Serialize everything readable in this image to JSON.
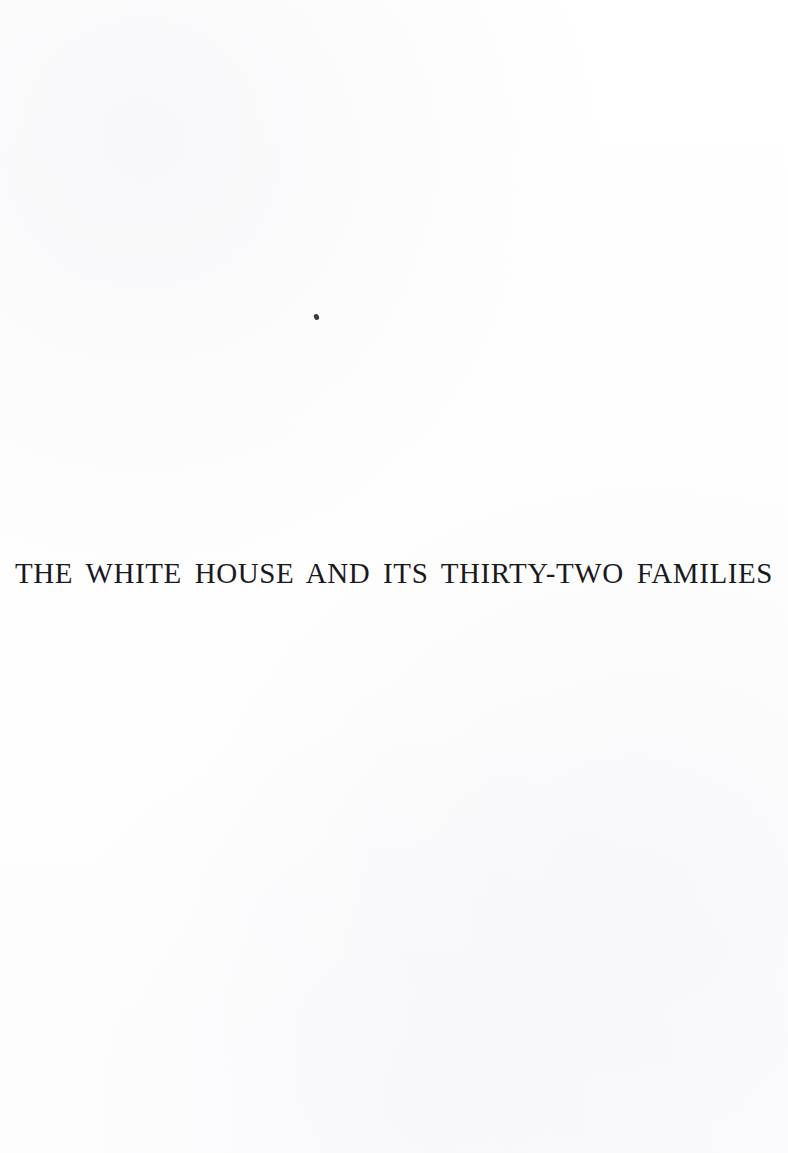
{
  "document": {
    "kind": "scanned-book-page",
    "page_type": "half-title-page",
    "background_color": "#fefefe",
    "text_color": "#1a1a1e",
    "title_line": "THE WHITE HOUSE AND ITS THIRTY-TWO FAMILIES",
    "artifacts": [
      {
        "name": "ink-speck",
        "description": "small stray ink mark",
        "x": 314,
        "y": 314,
        "width": 5,
        "height": 6,
        "color": "#2b2b30"
      }
    ]
  }
}
